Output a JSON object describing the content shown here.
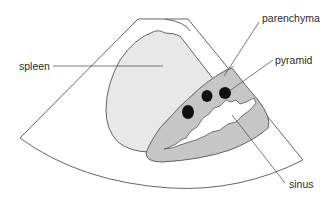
{
  "diagram": {
    "title": "",
    "labels": {
      "spleen": "spleen",
      "parenchyma": "parenchyma",
      "pyramid": "pyramid",
      "sinus": "sinus"
    },
    "colors": {
      "background": "#ffffff",
      "fan_outline": "#555555",
      "spleen_fill": "#e8e8e8",
      "parenchyma_fill": "#c8c8c8",
      "sinus_fill": "#ffffff",
      "pyramid_fill": "#111111"
    }
  }
}
